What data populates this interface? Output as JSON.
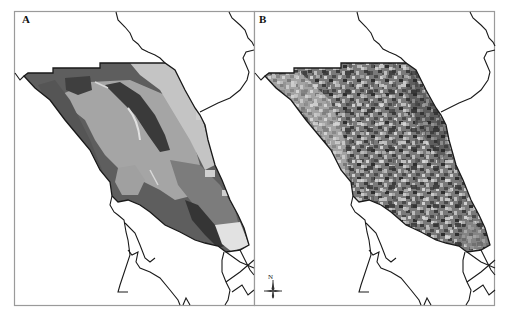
{
  "figure": {
    "panels": [
      {
        "id": "A",
        "label": "A",
        "description": "Classified zone map (smooth polygons, grayscale)"
      },
      {
        "id": "B",
        "label": "B",
        "description": "Fine-grained raster map (speckled grayscale)"
      }
    ],
    "north_arrow": {
      "label": "N"
    },
    "colors": {
      "frame": "#9a9a9a",
      "outline": "#1a1a1a",
      "gray_darkest": "#3a3a3a",
      "gray_dark": "#5e5e5e",
      "gray_mid": "#7c7c7c",
      "gray_light": "#a5a5a5",
      "gray_lighter": "#c4c4c4",
      "gray_pale": "#e2e2e2"
    }
  }
}
